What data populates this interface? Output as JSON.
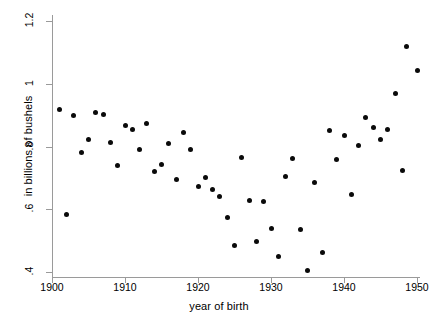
{
  "chart_data": {
    "type": "scatter",
    "title": "",
    "xlabel": "year of birth",
    "ylabel": "in billions of bushels",
    "xlim": [
      1899,
      1950.5
    ],
    "ylim": [
      0.385,
      1.2
    ],
    "grid": false,
    "legend": null,
    "xticks": [
      1900,
      1910,
      1920,
      1930,
      1940,
      1950
    ],
    "xtick_labels": [
      "1900",
      "1910",
      "1920",
      "1930",
      "1940",
      "1950"
    ],
    "yticks": [
      0.4,
      0.6,
      0.8,
      1.0,
      1.2
    ],
    "ytick_labels": [
      ".4",
      ".6",
      ".8",
      "1",
      "1.2"
    ],
    "marker": "filled-circle",
    "marker_color": "#0a0a0a",
    "points": [
      {
        "x": 1901,
        "y": 0.918
      },
      {
        "x": 1902,
        "y": 0.584
      },
      {
        "x": 1903,
        "y": 0.898
      },
      {
        "x": 1904,
        "y": 0.781
      },
      {
        "x": 1905,
        "y": 0.822
      },
      {
        "x": 1906,
        "y": 0.908
      },
      {
        "x": 1907,
        "y": 0.903
      },
      {
        "x": 1908,
        "y": 0.812
      },
      {
        "x": 1909,
        "y": 0.739
      },
      {
        "x": 1910,
        "y": 0.866
      },
      {
        "x": 1911,
        "y": 0.855
      },
      {
        "x": 1912,
        "y": 0.791
      },
      {
        "x": 1913,
        "y": 0.874
      },
      {
        "x": 1914,
        "y": 0.719
      },
      {
        "x": 1915,
        "y": 0.743
      },
      {
        "x": 1916,
        "y": 0.81
      },
      {
        "x": 1917,
        "y": 0.695
      },
      {
        "x": 1918,
        "y": 0.845
      },
      {
        "x": 1919,
        "y": 0.792
      },
      {
        "x": 1920,
        "y": 0.674
      },
      {
        "x": 1921,
        "y": 0.7
      },
      {
        "x": 1922,
        "y": 0.663
      },
      {
        "x": 1923,
        "y": 0.642
      },
      {
        "x": 1924,
        "y": 0.573
      },
      {
        "x": 1925,
        "y": 0.483
      },
      {
        "x": 1926,
        "y": 0.766
      },
      {
        "x": 1927,
        "y": 0.627
      },
      {
        "x": 1928,
        "y": 0.496
      },
      {
        "x": 1929,
        "y": 0.626
      },
      {
        "x": 1930,
        "y": 0.539
      },
      {
        "x": 1931,
        "y": 0.448
      },
      {
        "x": 1932,
        "y": 0.703
      },
      {
        "x": 1933,
        "y": 0.763
      },
      {
        "x": 1934,
        "y": 0.537
      },
      {
        "x": 1935,
        "y": 0.405
      },
      {
        "x": 1936,
        "y": 0.685
      },
      {
        "x": 1937,
        "y": 0.461
      },
      {
        "x": 1938,
        "y": 0.852
      },
      {
        "x": 1939,
        "y": 0.757
      },
      {
        "x": 1940,
        "y": 0.835
      },
      {
        "x": 1941,
        "y": 0.648
      },
      {
        "x": 1942,
        "y": 0.803
      },
      {
        "x": 1943,
        "y": 0.893
      },
      {
        "x": 1944,
        "y": 0.859
      },
      {
        "x": 1945,
        "y": 0.822
      },
      {
        "x": 1946,
        "y": 0.854
      },
      {
        "x": 1947,
        "y": 0.968
      },
      {
        "x": 1948,
        "y": 0.724
      },
      {
        "x": 1948.6,
        "y": 1.12
      },
      {
        "x": 1950,
        "y": 1.042
      }
    ]
  }
}
